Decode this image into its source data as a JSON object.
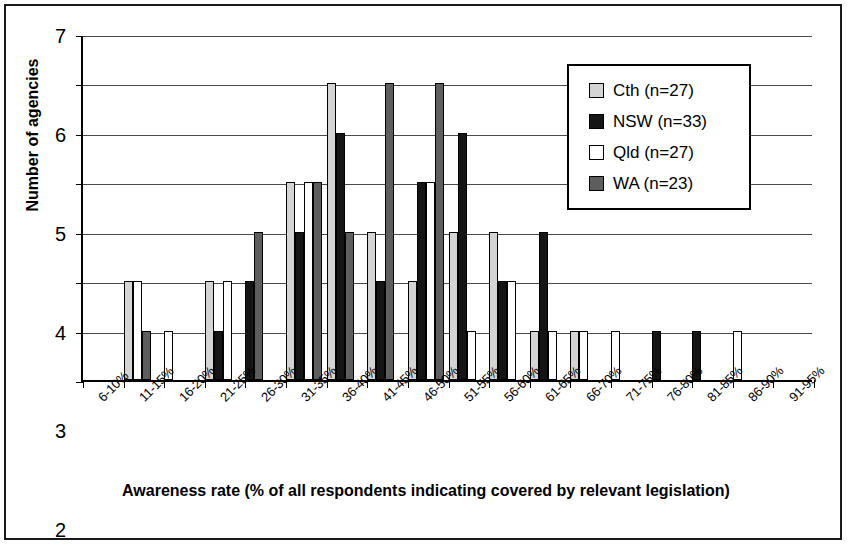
{
  "chart_data": {
    "type": "bar",
    "title": "",
    "xlabel": "Awareness rate (% of all respondents indicating covered by relevant legislation)",
    "ylabel": "Number of agencies",
    "ylim": [
      0,
      7
    ],
    "ytick_labels": [
      "0",
      "1",
      "2",
      "3",
      "4",
      "5",
      "6",
      "7"
    ],
    "grid": true,
    "legend_position": "top-right",
    "categories": [
      "6-10%",
      "11-15%",
      "16-20%",
      "21-25%",
      "26-30%",
      "31-35%",
      "36-40%",
      "41-45%",
      "46-50%",
      "51-55%",
      "56-60%",
      "61-65%",
      "66-70%",
      "71-75%",
      "76-80%",
      "81-85%",
      "86-90%",
      "91-95%"
    ],
    "series": [
      {
        "name": "Cth (n=27)",
        "label": "Cth (n=27)",
        "color": "#d4d4d4",
        "values": [
          0,
          2,
          0,
          2,
          0,
          4,
          6,
          3,
          2,
          3,
          3,
          1,
          1,
          0,
          0,
          0,
          0,
          0
        ]
      },
      {
        "name": "NSW (n=33)",
        "label": "NSW (n=33)",
        "color": "#151515",
        "values": [
          0,
          0,
          0,
          1,
          2,
          3,
          5,
          2,
          4,
          5,
          2,
          3,
          0,
          0,
          1,
          1,
          0,
          0
        ]
      },
      {
        "name": "Qld (n=27)",
        "label": "Qld (n=27)",
        "color": "#ffffff",
        "values": [
          0,
          2,
          1,
          2,
          0,
          4,
          0,
          0,
          4,
          1,
          2,
          1,
          1,
          1,
          0,
          0,
          1,
          0
        ]
      },
      {
        "name": "WA (n=23)",
        "label": "WA (n=23)",
        "color": "#5e5e5e",
        "values": [
          0,
          1,
          0,
          0,
          3,
          4,
          3,
          6,
          6,
          0,
          0,
          0,
          0,
          0,
          0,
          0,
          0,
          0
        ]
      }
    ]
  }
}
